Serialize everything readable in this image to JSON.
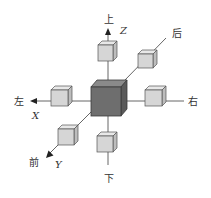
{
  "diagram": {
    "colors": {
      "center_front": "#6e6e6e",
      "center_top": "#8a8a8a",
      "center_side": "#5a5a5a",
      "small_front": "#d6d6d6",
      "small_top": "#e8e8e8",
      "small_side": "#bdbdbd",
      "line": "#555555"
    },
    "labels": {
      "up": "上",
      "down": "下",
      "left": "左",
      "right": "右",
      "front": "前",
      "back": "后"
    },
    "axes": {
      "x": "X",
      "y": "Y",
      "z": "Z"
    }
  }
}
